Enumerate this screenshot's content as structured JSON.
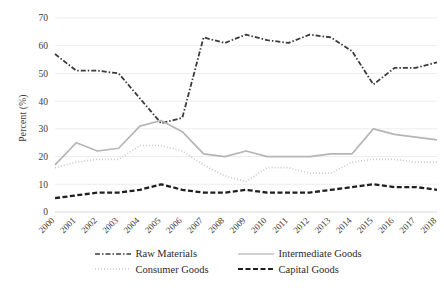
{
  "chart_data": {
    "type": "line",
    "title": "",
    "subtitle": "",
    "xlabel": "",
    "ylabel": "Percent (%)",
    "ylim": [
      0,
      70
    ],
    "ytick_step": 10,
    "yticks": [
      "0",
      "10",
      "20",
      "30",
      "40",
      "50",
      "60",
      "70"
    ],
    "grid": true,
    "grid_axis": "y",
    "legend_position": "bottom",
    "categories": [
      "2000",
      "2001",
      "2002",
      "2003",
      "2004",
      "2005",
      "2006",
      "2007",
      "2008",
      "2009",
      "2010",
      "2011",
      "2012",
      "2013",
      "2014",
      "2015",
      "2016",
      "2017",
      "2018"
    ],
    "series": [
      {
        "name": "Raw Materials",
        "style": "dash-dot",
        "color": "#3a3a3a",
        "values": [
          57,
          51,
          51,
          50,
          41,
          32,
          34,
          63,
          61,
          64,
          62,
          61,
          64,
          63,
          58,
          46,
          52,
          52,
          54
        ]
      },
      {
        "name": "Intermediate Goods",
        "style": "solid",
        "color": "#b5b5b5",
        "values": [
          17,
          25,
          22,
          23,
          31,
          33,
          29,
          21,
          20,
          22,
          20,
          20,
          20,
          21,
          21,
          30,
          28,
          27,
          26
        ]
      },
      {
        "name": "Consumer Goods",
        "style": "dotted",
        "color": "#c9c9c9",
        "values": [
          16,
          18,
          19,
          19,
          24,
          24,
          22,
          17,
          13,
          11,
          16,
          16,
          14,
          14,
          18,
          19,
          19,
          18,
          18
        ]
      },
      {
        "name": "Capital Goods",
        "style": "dashed",
        "color": "#1f1f1f",
        "values": [
          5,
          6,
          7,
          7,
          8,
          10,
          8,
          7,
          7,
          8,
          7,
          7,
          7,
          8,
          9,
          10,
          9,
          9,
          8
        ]
      }
    ]
  },
  "axis": {
    "ylabel": "Percent (%)"
  },
  "legend": {
    "items": [
      {
        "label": "Raw Materials"
      },
      {
        "label": "Intermediate Goods"
      },
      {
        "label": "Consumer Goods"
      },
      {
        "label": "Capital Goods"
      }
    ]
  },
  "caption": {
    "text": ""
  }
}
